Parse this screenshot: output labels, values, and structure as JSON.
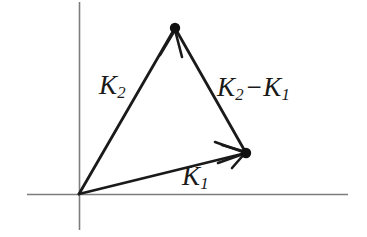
{
  "figure": {
    "background_color": "#ffffff",
    "axis_color": "#7d7d7d",
    "vector_color": "#1a1a1a",
    "label_color": "#1a1a1a"
  },
  "axes": {
    "origin": {
      "x": 79,
      "y": 194
    },
    "x_axis": {
      "from_x": 27,
      "to_x": 348,
      "y": 194
    },
    "y_axis": {
      "x": 79,
      "from_y": 2,
      "to_y": 230
    }
  },
  "labels": {
    "k2": {
      "symbol": "K",
      "subscript": "2"
    },
    "k1": {
      "symbol": "K",
      "subscript": "1"
    },
    "k2_minus_k1": {
      "symbol_a": "K",
      "subscript_a": "2",
      "operator": "−",
      "symbol_b": "K",
      "subscript_b": "1"
    }
  },
  "chart_data": {
    "type": "scatter",
    "xlabel": "",
    "ylabel": "",
    "grid": false,
    "legend": null,
    "points": [
      {
        "name": "origin",
        "x": 79,
        "y": 194,
        "marked": false
      },
      {
        "name": "k2-tip",
        "x": 175,
        "y": 28,
        "marked": true
      },
      {
        "name": "k1-tip",
        "x": 246,
        "y": 153,
        "marked": true
      }
    ],
    "vectors": [
      {
        "name": "K2",
        "label": "K2",
        "from": {
          "x": 79,
          "y": 194
        },
        "to": {
          "x": 175,
          "y": 28
        },
        "arrowhead": true
      },
      {
        "name": "K1",
        "label": "K1",
        "from": {
          "x": 79,
          "y": 194
        },
        "to": {
          "x": 246,
          "y": 153
        },
        "arrowhead": true
      },
      {
        "name": "K2-K1",
        "label": "K2 - K1",
        "from": {
          "x": 175,
          "y": 28
        },
        "to": {
          "x": 246,
          "y": 153
        },
        "arrowhead": true
      }
    ]
  }
}
